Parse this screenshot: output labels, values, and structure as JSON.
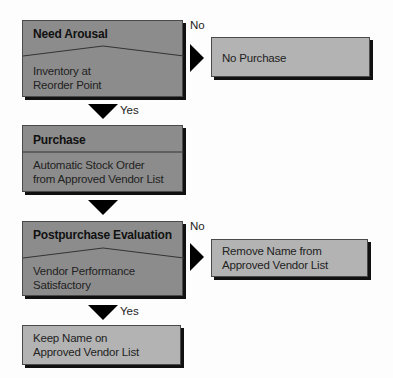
{
  "diagram": {
    "nodes": {
      "need_arousal": {
        "title": "Need Arousal",
        "line1": "Inventory at",
        "line2": "Reorder Point"
      },
      "no_purchase": {
        "text": "No Purchase"
      },
      "purchase": {
        "title": "Purchase",
        "line1": "Automatic Stock Order",
        "line2": "from Approved Vendor List"
      },
      "postpurchase": {
        "title": "Postpurchase Evaluation",
        "line1": "Vendor Performance",
        "line2": "Satisfactory"
      },
      "remove_name": {
        "line1": "Remove Name from",
        "line2": "Approved Vendor List"
      },
      "keep_name": {
        "line1": "Keep Name on",
        "line2": "Approved Vendor List"
      }
    },
    "edges": {
      "need_no": "No",
      "need_yes": "Yes",
      "post_no": "No",
      "post_yes": "Yes"
    },
    "colors": {
      "decision_box": "#8c8c8c",
      "outcome_box": "#b3b3b3",
      "arrow": "#000000"
    }
  }
}
